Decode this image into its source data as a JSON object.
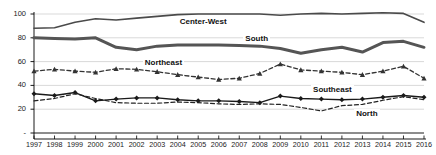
{
  "chart_data": {
    "type": "line",
    "title": "",
    "subtitle": "",
    "xlabel": "",
    "ylabel": "",
    "xlim": [
      1997,
      2016
    ],
    "ylim": [
      0,
      105
    ],
    "grid": true,
    "legend_position": "inline-labels",
    "yticks": [
      "-",
      "20",
      "40",
      "60",
      "80",
      "100"
    ],
    "ytick_values": [
      0,
      20,
      40,
      60,
      80,
      100
    ],
    "categories": [
      "1997",
      "1998",
      "1999",
      "2000",
      "2001",
      "2002",
      "2003",
      "2004",
      "2005",
      "2006",
      "2007",
      "2008",
      "2009",
      "2010",
      "2011",
      "2012",
      "2013",
      "2014",
      "2015",
      "2016"
    ],
    "series": [
      {
        "name": "Center-West",
        "style": "solid",
        "marker": "none",
        "color": "#4a4a4a",
        "width": 1.6,
        "values": [
          88,
          88.5,
          93,
          96,
          95,
          96.5,
          98,
          99.5,
          100,
          100,
          100,
          100,
          99,
          100,
          100.5,
          100,
          100.5,
          101,
          100.5,
          93
        ]
      },
      {
        "name": "South",
        "style": "solid",
        "marker": "none",
        "color": "#555555",
        "width": 3.0,
        "values": [
          80,
          79.5,
          79,
          80,
          72,
          70,
          73,
          74,
          74,
          74,
          73.5,
          73,
          71,
          67,
          70,
          72,
          68,
          76,
          77,
          72
        ]
      },
      {
        "name": "Northeast",
        "style": "dashed",
        "marker": "triangle",
        "color": "#333333",
        "width": 1.3,
        "values": [
          52,
          53.5,
          52,
          51,
          54,
          53.5,
          51.5,
          49,
          47,
          45,
          46,
          50,
          58,
          53,
          52,
          51,
          49,
          52,
          56,
          46
        ]
      },
      {
        "name": "Southeast",
        "style": "solid",
        "marker": "diamond",
        "color": "#1a1a1a",
        "width": 1.4,
        "values": [
          33,
          31.5,
          34,
          27,
          28.5,
          29.5,
          29.5,
          28,
          27,
          27,
          26.5,
          25.5,
          31,
          29,
          28.5,
          28,
          28.5,
          30,
          31.5,
          30
        ]
      },
      {
        "name": "North",
        "style": "dashed",
        "marker": "none",
        "color": "#222222",
        "width": 1.2,
        "values": [
          27,
          29,
          33,
          29,
          25.5,
          25,
          25,
          26,
          25.5,
          24.5,
          24,
          24.5,
          24,
          21.5,
          18.5,
          23,
          24,
          27.5,
          30.5,
          28
        ]
      }
    ],
    "annotations": [
      {
        "text": "Center-West",
        "x": 2004,
        "y": 93
      },
      {
        "text": "South",
        "x": 2007.2,
        "y": 79
      },
      {
        "text": "Northeast",
        "x": 2002.3,
        "y": 59
      },
      {
        "text": "Southeast",
        "x": 2010.5,
        "y": 36
      },
      {
        "text": "North",
        "x": 2012.6,
        "y": 16
      }
    ]
  }
}
